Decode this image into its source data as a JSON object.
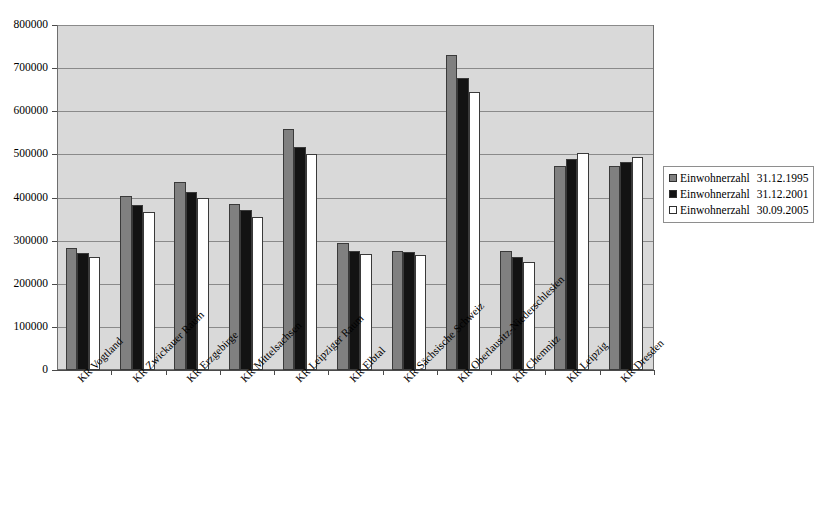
{
  "chart_data": {
    "type": "bar",
    "title": "",
    "xlabel": "",
    "ylabel": "",
    "ylim": [
      0,
      800000
    ],
    "ytick_step": 100000,
    "ytick_labels": [
      "0",
      "100000",
      "200000",
      "300000",
      "400000",
      "500000",
      "600000",
      "700000",
      "800000"
    ],
    "grid": true,
    "legend_position": "right",
    "categories": [
      "KR Vogtland",
      "KR Zwickauer Raum",
      "KR Erzgebirge",
      "KR Mittelsachsen",
      "KR Leipziger Raum",
      "KR Elbtal",
      "KR Sächsische Schweiz",
      "KR Oberlausitz-Niederschlesien",
      "KR Chemnitz",
      "KR Leipzig",
      "KR Dresden"
    ],
    "series": [
      {
        "name": "Einwohnerzahl  31.12.1995",
        "label": "Einwohnerzahl",
        "date": "31.12.1995",
        "color": "#808080",
        "values": [
          284000,
          403000,
          437000,
          385000,
          560000,
          295000,
          277000,
          730000,
          277000,
          474000,
          473000
        ]
      },
      {
        "name": "Einwohnerzahl  31.12.2001",
        "label": "Einwohnerzahl",
        "date": "31.12.2001",
        "color": "#131313",
        "values": [
          271000,
          382000,
          413000,
          370000,
          518000,
          276000,
          273000,
          678000,
          261000,
          490000,
          483000
        ]
      },
      {
        "name": "Einwohnerzahl  30.09.2005",
        "label": "Einwohnerzahl",
        "date": "30.09.2005",
        "color": "#ffffff",
        "values": [
          261000,
          366000,
          398000,
          355000,
          501000,
          268000,
          267000,
          645000,
          250000,
          503000,
          495000
        ]
      }
    ]
  }
}
